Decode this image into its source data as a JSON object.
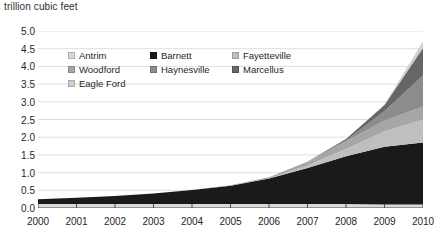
{
  "chart_data": {
    "type": "area",
    "stacked": true,
    "title": "trillion cubic feet",
    "xlabel": "",
    "ylabel": "trillion cubic feet",
    "grid": true,
    "legend_position": "inside-top-left",
    "x": [
      2000,
      2001,
      2002,
      2003,
      2004,
      2005,
      2006,
      2007,
      2008,
      2009,
      2010
    ],
    "categories": [
      "2000",
      "2001",
      "2002",
      "2003",
      "2004",
      "2005",
      "2006",
      "2007",
      "2008",
      "2009",
      "2010"
    ],
    "xlim": [
      2000,
      2010
    ],
    "ylim": [
      0.0,
      5.0
    ],
    "yticks": [
      "0.0",
      "0.5",
      "1.0",
      "1.5",
      "2.0",
      "2.5",
      "3.0",
      "3.5",
      "4.0",
      "4.5",
      "5.0"
    ],
    "ytick_values": [
      0.0,
      0.5,
      1.0,
      1.5,
      2.0,
      2.5,
      3.0,
      3.5,
      4.0,
      4.5,
      5.0
    ],
    "series": [
      {
        "name": "Antrim",
        "color": "#d9d9d9",
        "values": [
          0.11,
          0.11,
          0.11,
          0.11,
          0.11,
          0.11,
          0.11,
          0.11,
          0.11,
          0.1,
          0.1
        ]
      },
      {
        "name": "Barnett",
        "color": "#1a1a1a",
        "values": [
          0.14,
          0.18,
          0.23,
          0.3,
          0.4,
          0.52,
          0.72,
          1.02,
          1.35,
          1.63,
          1.75
        ]
      },
      {
        "name": "Fayetteville",
        "color": "#bfbfbf",
        "values": [
          0.0,
          0.0,
          0.0,
          0.0,
          0.0,
          0.0,
          0.01,
          0.07,
          0.21,
          0.44,
          0.65
        ]
      },
      {
        "name": "Woodford",
        "color": "#a6a6a6",
        "values": [
          0.0,
          0.0,
          0.0,
          0.0,
          0.0,
          0.01,
          0.03,
          0.1,
          0.21,
          0.3,
          0.36
        ]
      },
      {
        "name": "Haynesville",
        "color": "#8c8c8c",
        "values": [
          0.0,
          0.0,
          0.0,
          0.0,
          0.0,
          0.0,
          0.0,
          0.0,
          0.03,
          0.27,
          0.88
        ]
      },
      {
        "name": "Marcellus",
        "color": "#666666",
        "values": [
          0.0,
          0.0,
          0.0,
          0.0,
          0.0,
          0.0,
          0.0,
          0.01,
          0.04,
          0.17,
          0.78
        ]
      },
      {
        "name": "Eagle Ford",
        "color": "#d0d0d0",
        "values": [
          0.0,
          0.0,
          0.0,
          0.0,
          0.0,
          0.0,
          0.0,
          0.0,
          0.0,
          0.02,
          0.18
        ]
      }
    ],
    "totals": [
      0.25,
      0.29,
      0.34,
      0.41,
      0.51,
      0.64,
      0.87,
      1.31,
      1.95,
      2.93,
      4.7
    ]
  },
  "legend": {
    "rows": [
      [
        {
          "label": "Antrim",
          "color": "#d9d9d9"
        },
        {
          "label": "Barnett",
          "color": "#1a1a1a"
        },
        {
          "label": "Fayetteville",
          "color": "#bfbfbf"
        }
      ],
      [
        {
          "label": "Woodford",
          "color": "#a6a6a6"
        },
        {
          "label": "Haynesville",
          "color": "#8c8c8c"
        },
        {
          "label": "Marcellus",
          "color": "#666666"
        }
      ],
      [
        {
          "label": "Eagle Ford",
          "color": "#d0d0d0"
        }
      ]
    ]
  },
  "style": {
    "grid_color": "#d5d5d5",
    "axis_color": "#4d4d4d",
    "text_color": "#1f1f1f",
    "background": "#ffffff"
  }
}
